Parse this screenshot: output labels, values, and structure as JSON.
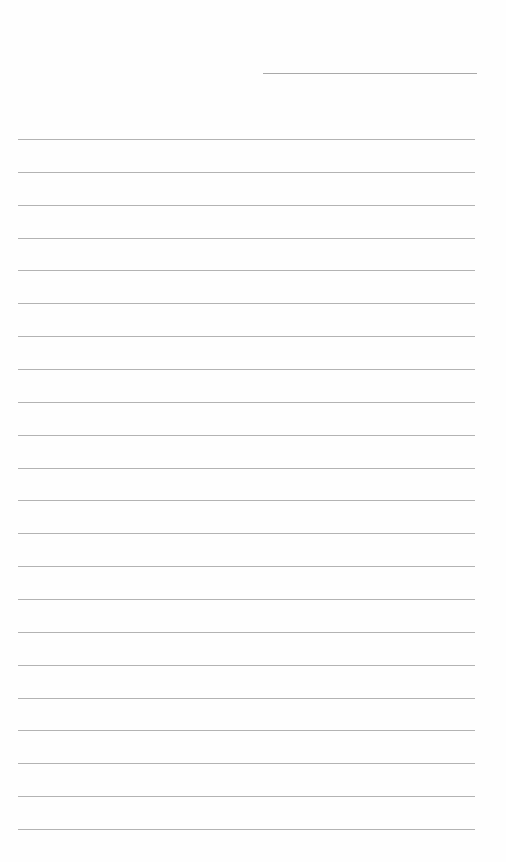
{
  "page": {
    "type": "lined-paper",
    "background_color": "#fefefe",
    "line_color": "#b3b3b3"
  },
  "header_line": {
    "x_start": 263,
    "x_end": 477,
    "y": 73,
    "color": "#a9a9a9"
  },
  "ruled_lines": {
    "count": 22,
    "x_start": 18,
    "x_end": 475,
    "first_y": 139,
    "spacing": 32.86
  }
}
